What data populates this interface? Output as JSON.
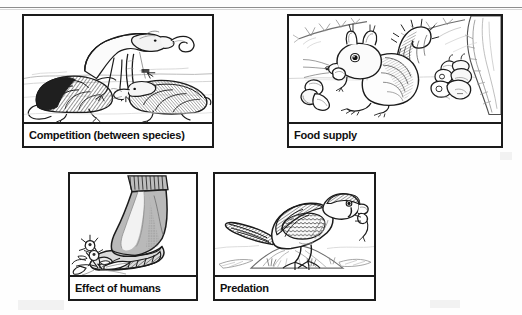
{
  "document": {
    "title": "Factors affecting populations — illustrated panels",
    "top_rule": true,
    "panel_count": 4
  },
  "panels": [
    {
      "id": "competition",
      "caption": "Competition (between species)",
      "illustration": "three-shrews-competing-for-worm",
      "illustration_name": "shrews-competing-line-drawing",
      "position": {
        "row": 1,
        "column": 1
      }
    },
    {
      "id": "food-supply",
      "caption": "Food supply",
      "illustration": "squirrel-on-ground-with-nuts-and-acorns-beneath-tree-branches",
      "illustration_name": "squirrel-food-supply-line-drawing",
      "position": {
        "row": 1,
        "column": 2
      }
    },
    {
      "id": "effect-of-humans",
      "caption": "Effect of humans",
      "illustration": "rubber-boot-treading-on-a-flowering-plant",
      "illustration_name": "boot-crushing-plant-line-drawing",
      "position": {
        "row": 2,
        "column": 1
      }
    },
    {
      "id": "predation",
      "caption": "Predation",
      "illustration": "bird-of-prey-perched-on-rock-holding-prey-in-beak",
      "illustration_name": "raptor-with-prey-line-drawing",
      "position": {
        "row": 2,
        "column": 2
      }
    }
  ],
  "style": {
    "page_background": "#fefefe",
    "panel_border": "#1b1b1b",
    "ink": "#1b1b1b",
    "caption_text": "#101010",
    "rule": "#8e8e8e",
    "shade_light": "#d9d9d9",
    "shade_mid": "#9a9a9a",
    "shade_dark": "#555555"
  }
}
